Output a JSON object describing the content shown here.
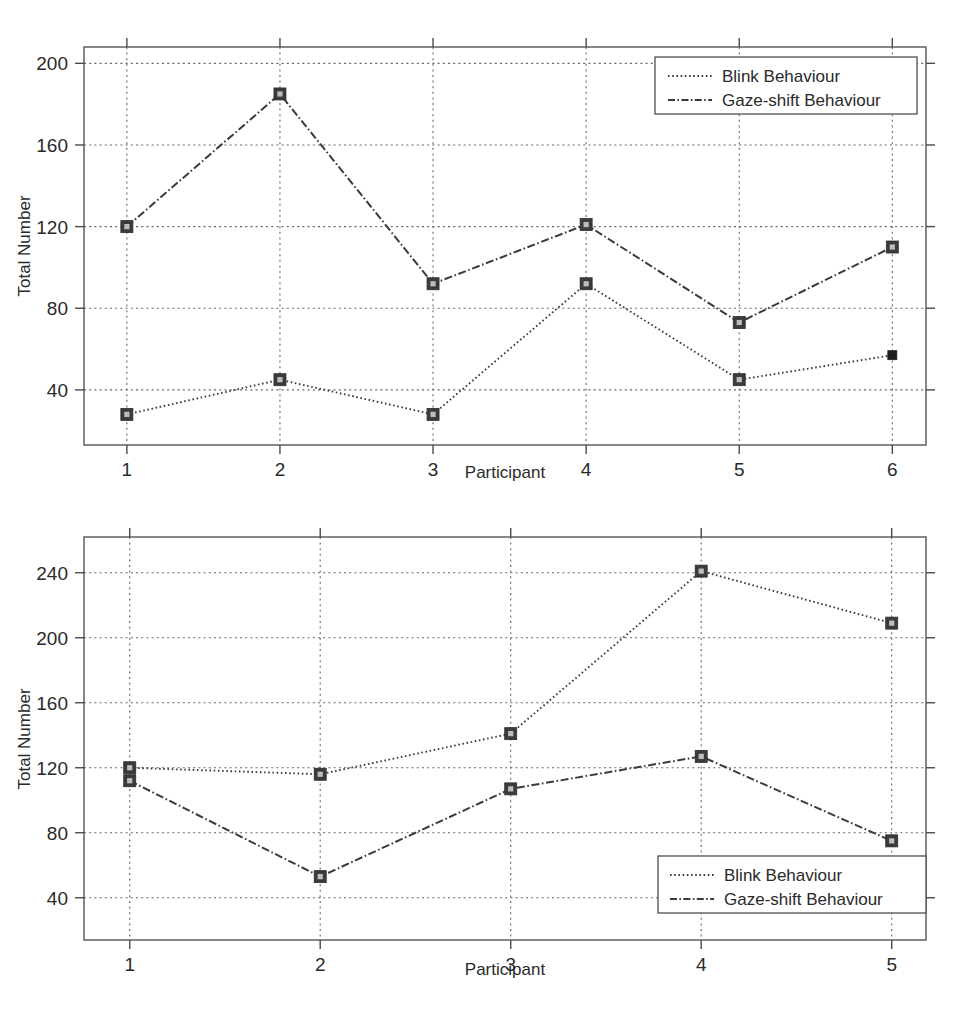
{
  "chart_data": [
    {
      "id": "top",
      "type": "line",
      "title": "",
      "xlabel": "Participant",
      "ylabel": "Total Number",
      "categories": [
        1,
        2,
        3,
        4,
        5,
        6
      ],
      "xticklabels": [
        "1",
        "2",
        "3",
        "4",
        "5",
        "6"
      ],
      "yticklabels": [
        "40",
        "80",
        "120",
        "160",
        "200"
      ],
      "yticks": [
        40,
        80,
        120,
        160,
        200
      ],
      "xlim": [
        0.72,
        6.22
      ],
      "ylim": [
        13,
        208
      ],
      "grid": true,
      "legend_position": "top-right",
      "series": [
        {
          "name": "Blink Behaviour",
          "linestyle": "dotted",
          "marker": "square",
          "values": [
            28,
            45,
            28,
            92,
            45,
            57
          ]
        },
        {
          "name": "Gaze-shift Behaviour",
          "linestyle": "dash-dot",
          "marker": "square",
          "values": [
            120,
            185,
            92,
            121,
            73,
            110
          ]
        }
      ]
    },
    {
      "id": "bottom",
      "type": "line",
      "title": "",
      "xlabel": "Participant",
      "ylabel": "Total Number",
      "categories": [
        1,
        2,
        3,
        4,
        5
      ],
      "xticklabels": [
        "1",
        "2",
        "3",
        "4",
        "5"
      ],
      "yticklabels": [
        "40",
        "80",
        "120",
        "160",
        "200",
        "240"
      ],
      "yticks": [
        40,
        80,
        120,
        160,
        200,
        240
      ],
      "xlim": [
        0.76,
        5.18
      ],
      "ylim": [
        14,
        262
      ],
      "grid": true,
      "legend_position": "bottom-right",
      "series": [
        {
          "name": "Blink Behaviour",
          "linestyle": "dotted",
          "marker": "square",
          "values": [
            120,
            116,
            141,
            241,
            209
          ]
        },
        {
          "name": "Gaze-shift Behaviour",
          "linestyle": "dash-dot",
          "marker": "square",
          "values": [
            112,
            53,
            107,
            127,
            75
          ]
        }
      ]
    }
  ],
  "colors": {
    "background": "#ffffff",
    "axis": "#555555",
    "grid": "#666666",
    "blink_series": "#3c3c3c",
    "gaze_series": "#3a3a3a",
    "marker_fill": "#3b3b3b",
    "text": "#2a2a2a"
  }
}
